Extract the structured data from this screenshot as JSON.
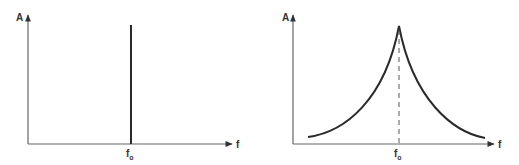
{
  "diagrams": [
    {
      "id": "line-spectrum",
      "y_axis_label": "A",
      "x_axis_label": "f",
      "marker_label_main": "f",
      "marker_label_sub": "o",
      "description": "Single spectral line at frequency f0"
    },
    {
      "id": "broadened-spectrum",
      "y_axis_label": "A",
      "x_axis_label": "f",
      "marker_label_main": "f",
      "marker_label_sub": "o",
      "description": "Cusp-shaped peak centered at f0 with dashed center line"
    }
  ],
  "colors": {
    "line": "#2a2a2a",
    "axis": "#555555"
  }
}
